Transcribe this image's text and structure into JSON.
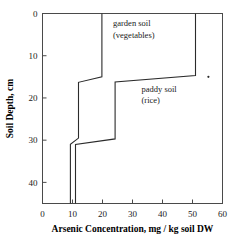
{
  "chart_data": {
    "type": "line",
    "title": "",
    "xlabel": "Arsenic Concentration, mg / kg soil DW",
    "ylabel": "Soil Depth, cm",
    "xlim": [
      0,
      60
    ],
    "ylim": [
      45,
      0
    ],
    "y_inverted": true,
    "grid": false,
    "legend_position": "inline-annotation",
    "xticks": [
      0,
      10,
      20,
      30,
      40,
      50,
      60
    ],
    "xticklabels": [
      "0",
      "10",
      "20",
      "30",
      "40",
      "50",
      "60"
    ],
    "yticks": [
      0,
      10,
      20,
      30,
      40
    ],
    "yticklabels": [
      "0",
      "10",
      "20",
      "30",
      "40"
    ],
    "series": [
      {
        "name": "garden soil (vegetables)",
        "step_style": "vertical-profile",
        "points": [
          {
            "concentration": 19.8,
            "depth": 0.0
          },
          {
            "concentration": 19.8,
            "depth": 15.0
          },
          {
            "concentration": 12.0,
            "depth": 16.3
          },
          {
            "concentration": 12.0,
            "depth": 29.5
          },
          {
            "concentration": 9.3,
            "depth": 31.0
          },
          {
            "concentration": 9.3,
            "depth": 45.0
          }
        ]
      },
      {
        "name": "paddy soil (rice)",
        "step_style": "vertical-profile",
        "points": [
          {
            "concentration": 51.0,
            "depth": 0.0
          },
          {
            "concentration": 51.0,
            "depth": 14.7
          },
          {
            "concentration": 24.2,
            "depth": 16.2
          },
          {
            "concentration": 24.2,
            "depth": 29.7
          },
          {
            "concentration": 11.0,
            "depth": 31.0
          },
          {
            "concentration": 11.0,
            "depth": 45.0
          }
        ]
      }
    ],
    "markers": [
      {
        "concentration": 55.3,
        "depth": 15.0,
        "label": ""
      }
    ],
    "annotations": [
      {
        "id": "garden",
        "lines": [
          "garden soil",
          "(vegetables)"
        ],
        "concentration": 23.5,
        "depth": 3.0
      },
      {
        "id": "paddy",
        "lines": [
          "paddy soil",
          "(rice)"
        ],
        "concentration": 33.0,
        "depth": 18.5
      }
    ]
  }
}
